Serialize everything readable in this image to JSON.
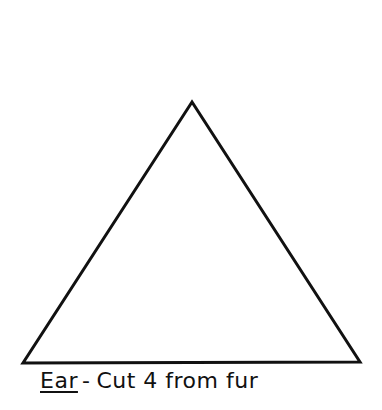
{
  "pattern": {
    "shape": "triangle",
    "stroke_color": "#111111",
    "points": {
      "apex": [
        192,
        102
      ],
      "left": [
        23,
        363
      ],
      "right": [
        360,
        362
      ]
    }
  },
  "caption": {
    "piece_name": "Ear",
    "separator": "-",
    "instruction": "Cut 4 from fur"
  }
}
